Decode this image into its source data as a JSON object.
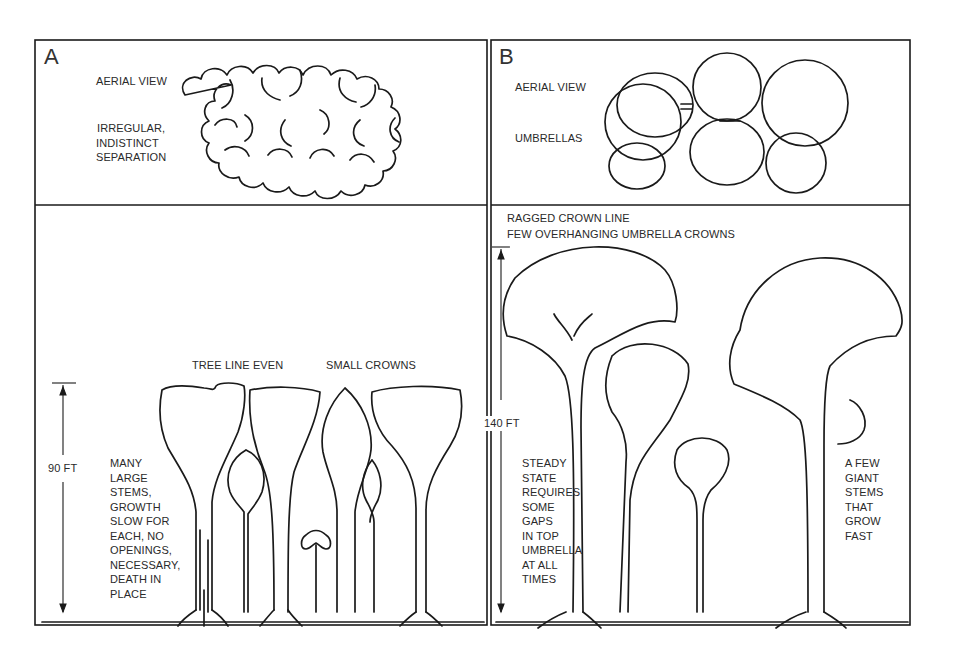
{
  "figure": {
    "panels": [
      {
        "id": "A",
        "letter": "A",
        "aerial": {
          "title": "AERIAL VIEW",
          "description_lines": [
            "IRREGULAR,",
            "INDISTINCT",
            "SEPARATION"
          ]
        },
        "profile": {
          "labels": [
            "TREE LINE EVEN",
            "SMALL CROWNS"
          ],
          "height_marker": "90 FT",
          "notes": [
            "MANY",
            "LARGE",
            "STEMS,",
            "GROWTH",
            "SLOW FOR",
            "EACH, NO",
            "OPENINGS,",
            "NECESSARY,",
            "DEATH IN",
            "PLACE"
          ]
        }
      },
      {
        "id": "B",
        "letter": "B",
        "aerial": {
          "title": "AERIAL VIEW",
          "description_lines": [
            "UMBRELLAS"
          ]
        },
        "profile": {
          "heading_lines": [
            "RAGGED CROWN LINE",
            "FEW OVERHANGING UMBRELLA CROWNS"
          ],
          "height_marker": "140 FT",
          "notes_left": [
            "STEADY",
            "STATE",
            "REQUIRES",
            "SOME",
            "GAPS",
            "IN TOP",
            "UMBRELLA",
            "AT ALL",
            "TIMES"
          ],
          "notes_right": [
            "A FEW",
            "GIANT",
            "STEMS",
            "THAT",
            "GROW",
            "FAST"
          ]
        }
      }
    ]
  }
}
